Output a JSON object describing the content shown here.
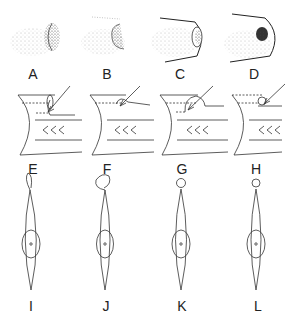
{
  "figure": {
    "rows": [
      {
        "kind": "stippled-tube-end",
        "panels": [
          {
            "label": "A",
            "cx": 33
          },
          {
            "label": "B",
            "cx": 105
          },
          {
            "label": "C",
            "cx": 180
          },
          {
            "label": "D",
            "cx": 255
          }
        ]
      },
      {
        "kind": "tube-section-with-arrow",
        "panels": [
          {
            "label": "E",
            "cx": 33
          },
          {
            "label": "F",
            "cx": 105
          },
          {
            "label": "G",
            "cx": 180
          },
          {
            "label": "H",
            "cx": 255
          }
        ]
      },
      {
        "kind": "spindle-with-head",
        "panels": [
          {
            "label": "I",
            "cx": 33
          },
          {
            "label": "J",
            "cx": 105
          },
          {
            "label": "K",
            "cx": 180
          },
          {
            "label": "L",
            "cx": 255
          }
        ]
      }
    ],
    "colors": {
      "ink": "#333333",
      "background": "#ffffff"
    }
  }
}
